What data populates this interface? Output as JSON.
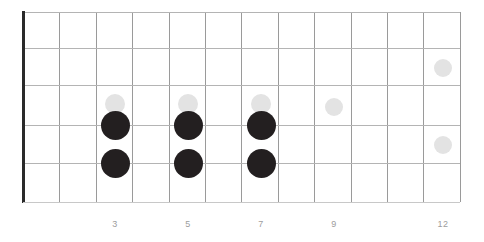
{
  "diagram": {
    "type": "guitar-fretboard",
    "title": "",
    "geometry": {
      "board_left": 23,
      "board_top": 12,
      "board_width": 437,
      "board_height": 190,
      "fret_count": 12,
      "string_count": 6,
      "fret_spacing": 36.42,
      "string_spacing_y": [
        12,
        48,
        85,
        125,
        163,
        202
      ]
    },
    "colors": {
      "background": "#ffffff",
      "fret_line": "#9a9a9a",
      "string_line": "#b4b4b4",
      "nut": "#2a2a2a",
      "root_dot": "#231f20",
      "ghost_dot": "#e3e3e3",
      "fret_label": "#9d9d9d"
    },
    "fret_lines": [
      {
        "index": 0,
        "x": 23
      },
      {
        "index": 1,
        "x": 59
      },
      {
        "index": 2,
        "x": 96
      },
      {
        "index": 3,
        "x": 132
      },
      {
        "index": 4,
        "x": 169
      },
      {
        "index": 5,
        "x": 205
      },
      {
        "index": 6,
        "x": 241
      },
      {
        "index": 7,
        "x": 278
      },
      {
        "index": 8,
        "x": 314
      },
      {
        "index": 9,
        "x": 351
      },
      {
        "index": 10,
        "x": 387
      },
      {
        "index": 11,
        "x": 423
      },
      {
        "index": 12,
        "x": 460
      }
    ],
    "string_lines": [
      {
        "index": 0,
        "y": 12
      },
      {
        "index": 1,
        "y": 48
      },
      {
        "index": 2,
        "y": 85
      },
      {
        "index": 3,
        "y": 125
      },
      {
        "index": 4,
        "y": 163
      },
      {
        "index": 5,
        "y": 202
      }
    ],
    "nut": {
      "x": 22,
      "y": 11,
      "width": 3,
      "height": 192
    },
    "fret_numbers": [
      {
        "label": "3",
        "fret": 3,
        "x": 115
      },
      {
        "label": "5",
        "fret": 5,
        "x": 188
      },
      {
        "label": "7",
        "fret": 7,
        "x": 261
      },
      {
        "label": "9",
        "fret": 9,
        "x": 334
      },
      {
        "label": "12",
        "fret": 12,
        "x": 443
      }
    ],
    "notes": [
      {
        "id": "ghost-f3-s2",
        "style": "ghost",
        "fret": 3,
        "string": 2,
        "cx": 115,
        "cy": 104,
        "d": 20
      },
      {
        "id": "root-f3-s3",
        "style": "root",
        "fret": 3,
        "string": 3,
        "cx": 115,
        "cy": 125,
        "d": 29
      },
      {
        "id": "root-f3-s4",
        "style": "root",
        "fret": 3,
        "string": 4,
        "cx": 115,
        "cy": 163,
        "d": 29
      },
      {
        "id": "ghost-f5-s2",
        "style": "ghost",
        "fret": 5,
        "string": 2,
        "cx": 188,
        "cy": 104,
        "d": 20
      },
      {
        "id": "root-f5-s3",
        "style": "root",
        "fret": 5,
        "string": 3,
        "cx": 188,
        "cy": 125,
        "d": 29
      },
      {
        "id": "root-f5-s4",
        "style": "root",
        "fret": 5,
        "string": 4,
        "cx": 188,
        "cy": 163,
        "d": 29
      },
      {
        "id": "ghost-f7-s2",
        "style": "ghost",
        "fret": 7,
        "string": 2,
        "cx": 261,
        "cy": 104,
        "d": 20
      },
      {
        "id": "root-f7-s3",
        "style": "root",
        "fret": 7,
        "string": 3,
        "cx": 261,
        "cy": 125,
        "d": 29
      },
      {
        "id": "root-f7-s4",
        "style": "root",
        "fret": 7,
        "string": 4,
        "cx": 261,
        "cy": 163,
        "d": 29
      },
      {
        "id": "ghost-f9-s2",
        "style": "ghost",
        "fret": 9,
        "string": 2,
        "cx": 334,
        "cy": 107,
        "d": 18
      },
      {
        "id": "ghost-f12-s1",
        "style": "ghost",
        "fret": 12,
        "string": 1,
        "cx": 443,
        "cy": 68,
        "d": 18
      },
      {
        "id": "ghost-f12-s3",
        "style": "ghost",
        "fret": 12,
        "string": 3,
        "cx": 443,
        "cy": 145,
        "d": 18
      }
    ]
  }
}
